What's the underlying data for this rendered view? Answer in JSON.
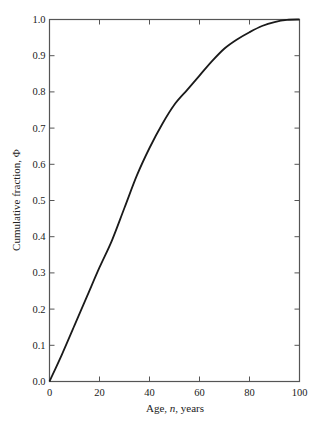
{
  "chart_data": {
    "type": "line",
    "title": "",
    "xlabel": "Age, n, years",
    "xlabel_parts": {
      "pre": "Age, ",
      "italic": "n",
      "post": ", years"
    },
    "ylabel": "Cumulative fraction, Φ",
    "xlim": [
      0,
      100
    ],
    "ylim": [
      0,
      1.0
    ],
    "x_ticks": [
      0,
      20,
      40,
      60,
      80,
      100
    ],
    "x_tick_labels": [
      "0",
      "20",
      "40",
      "60",
      "80",
      "100"
    ],
    "y_ticks": [
      0,
      0.1,
      0.2,
      0.3,
      0.4,
      0.5,
      0.6,
      0.7,
      0.8,
      0.9,
      1.0
    ],
    "y_tick_labels": [
      "0.0",
      "0.1",
      "0.2",
      "0.3",
      "0.4",
      "0.5",
      "0.6",
      "0.7",
      "0.8",
      "0.9",
      "1.0"
    ],
    "grid": false,
    "legend": null,
    "series": [
      {
        "name": "Cumulative fraction",
        "color": "#1a1a1a",
        "x": [
          0,
          5,
          10,
          15,
          20,
          25,
          30,
          35,
          40,
          45,
          50,
          55,
          60,
          65,
          70,
          75,
          80,
          85,
          90,
          95,
          100
        ],
        "y": [
          0,
          0.075,
          0.155,
          0.235,
          0.315,
          0.39,
          0.48,
          0.57,
          0.645,
          0.71,
          0.765,
          0.805,
          0.845,
          0.885,
          0.92,
          0.945,
          0.965,
          0.982,
          0.993,
          0.999,
          1.0
        ]
      }
    ]
  },
  "colors": {
    "axis": "#555555",
    "line": "#1a1a1a",
    "text": "#222222"
  }
}
